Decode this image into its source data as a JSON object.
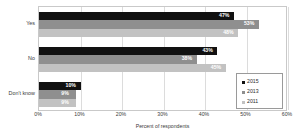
{
  "chart_data": {
    "type": "bar",
    "orientation": "horizontal",
    "title": "",
    "xlabel": "Percent of respondents",
    "ylabel": "",
    "xlim": [
      0,
      60
    ],
    "xticks": [
      "0%",
      "10%",
      "20%",
      "30%",
      "40%",
      "50%",
      "60%"
    ],
    "xtick_values": [
      0,
      10,
      20,
      30,
      40,
      50,
      60
    ],
    "grid": true,
    "legend_position": "center-right",
    "categories": [
      "Yes",
      "No",
      "Don't know"
    ],
    "series": [
      {
        "name": "2015",
        "color": "#111111",
        "values": [
          47,
          43,
          10
        ],
        "labels": [
          "47%",
          "43%",
          "10%"
        ]
      },
      {
        "name": "2013",
        "color": "#8f8f8f",
        "values": [
          53,
          38,
          9
        ],
        "labels": [
          "53%",
          "38%",
          "9%"
        ]
      },
      {
        "name": "2011",
        "color": "#c2c2c2",
        "values": [
          48,
          45,
          9
        ],
        "labels": [
          "48%",
          "45%",
          "9%"
        ]
      }
    ]
  },
  "legend": {
    "items": [
      {
        "label": "2015",
        "color": "#111111"
      },
      {
        "label": "2013",
        "color": "#8f8f8f"
      },
      {
        "label": "2011",
        "color": "#c2c2c2"
      }
    ]
  }
}
